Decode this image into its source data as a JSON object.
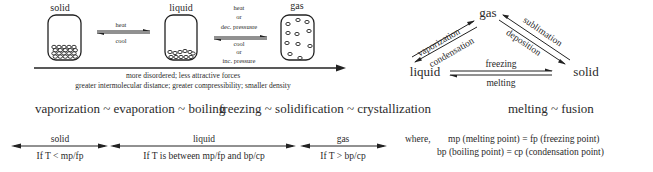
{
  "states_row": {
    "solid_label": "solid",
    "liquid_label": "liquid",
    "gas_label": "gas",
    "solid_liquid_forward": "heat",
    "solid_liquid_reverse": "cool",
    "liquid_gas_forward": [
      "heat",
      "or",
      "dec. pressusre"
    ],
    "liquid_gas_reverse": [
      "cool",
      "or",
      "inc. pressure"
    ],
    "trend_line1": "more disordered;   less attractive forces",
    "trend_line2": "greater intermolecular distance;  greater compressibility;  smaller density"
  },
  "triangle": {
    "gas": "gas",
    "liquid": "liquid",
    "solid": "solid",
    "liquid_to_gas": "vaporization",
    "gas_to_liquid": "condensation",
    "solid_to_gas": "sublimation",
    "gas_to_solid": "deposition",
    "liquid_to_solid": "freezing",
    "solid_to_liquid": "melting"
  },
  "synonyms": {
    "vaporization": "vaporization ~ evaporation ~ boiling",
    "freezing": "freezing ~ solidification ~ crystallization",
    "melting": "melting ~ fusion"
  },
  "ranges": [
    {
      "state": "solid",
      "condition": "If  T < mp/fp"
    },
    {
      "state": "liquid",
      "condition": "If T is between mp/fp and bp/cp"
    },
    {
      "state": "gas",
      "condition": "If  T > bp/cp"
    }
  ],
  "definitions": {
    "prefix": "where,",
    "line1": "mp (melting point) = fp (freezing point)",
    "line2": "bp (boiling point) = cp (condensation point)"
  }
}
